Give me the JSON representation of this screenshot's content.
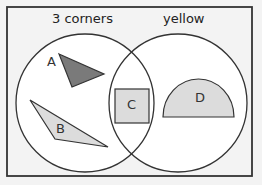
{
  "diagram": {
    "type": "venn",
    "sets": [
      {
        "label": "3 corners"
      },
      {
        "label": "yellow"
      }
    ],
    "items": [
      {
        "label": "A",
        "shape": "triangle",
        "fill": "#7a7a7a",
        "region": "3 corners only"
      },
      {
        "label": "B",
        "shape": "triangle",
        "fill": "#dcdcdc",
        "region": "3 corners only"
      },
      {
        "label": "C",
        "shape": "square",
        "fill": "#dcdcdc",
        "region": "intersection"
      },
      {
        "label": "D",
        "shape": "semicircle",
        "fill": "#dcdcdc",
        "region": "yellow only"
      }
    ],
    "colors": {
      "background": "#f3f3f3",
      "circle_fill": "#ffffff",
      "stroke": "#333333",
      "dark_fill": "#7a7a7a",
      "light_fill": "#dcdcdc"
    }
  }
}
